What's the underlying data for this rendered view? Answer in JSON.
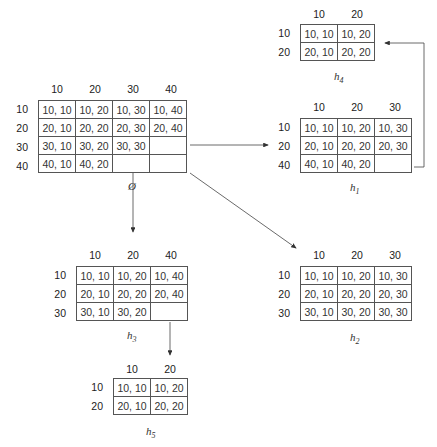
{
  "tables": {
    "empty": {
      "label": "Ø",
      "label_sub": "",
      "col_headers": [
        "10",
        "20",
        "30",
        "40"
      ],
      "row_headers": [
        "10",
        "20",
        "30",
        "40"
      ],
      "cells": [
        [
          "10, 10",
          "10, 20",
          "10, 30",
          "10, 40"
        ],
        [
          "20, 10",
          "20, 20",
          "20, 30",
          "20, 40"
        ],
        [
          "30, 10",
          "30, 20",
          "30, 30",
          ""
        ],
        [
          "40, 10",
          "40, 20",
          "",
          ""
        ]
      ]
    },
    "h1": {
      "label": "h",
      "label_sub": "1",
      "col_headers": [
        "10",
        "20",
        "30"
      ],
      "row_headers": [
        "10",
        "20",
        "40"
      ],
      "cells": [
        [
          "10, 10",
          "10, 20",
          "10, 30"
        ],
        [
          "20, 10",
          "20, 20",
          "20, 30"
        ],
        [
          "40, 10",
          "40, 20",
          ""
        ]
      ]
    },
    "h2": {
      "label": "h",
      "label_sub": "2",
      "col_headers": [
        "10",
        "20",
        "30"
      ],
      "row_headers": [
        "10",
        "20",
        "30"
      ],
      "cells": [
        [
          "10, 10",
          "10, 20",
          "10, 30"
        ],
        [
          "20, 10",
          "20, 20",
          "20, 30"
        ],
        [
          "30, 10",
          "30, 20",
          "30, 30"
        ]
      ]
    },
    "h3": {
      "label": "h",
      "label_sub": "3",
      "col_headers": [
        "10",
        "20",
        "40"
      ],
      "row_headers": [
        "10",
        "20",
        "30"
      ],
      "cells": [
        [
          "10, 10",
          "10, 20",
          "10, 40"
        ],
        [
          "20, 10",
          "20, 20",
          "20, 40"
        ],
        [
          "30, 10",
          "30, 20",
          ""
        ]
      ]
    },
    "h4": {
      "label": "h",
      "label_sub": "4",
      "col_headers": [
        "10",
        "20"
      ],
      "row_headers": [
        "10",
        "20"
      ],
      "cells": [
        [
          "10, 10",
          "10, 20"
        ],
        [
          "20, 10",
          "20, 20"
        ]
      ]
    },
    "h5": {
      "label": "h",
      "label_sub": "5",
      "col_headers": [
        "10",
        "20"
      ],
      "row_headers": [
        "10",
        "20"
      ],
      "cells": [
        [
          "10, 10",
          "10, 20"
        ],
        [
          "20, 10",
          "20, 20"
        ]
      ]
    }
  },
  "edges": [
    {
      "from": "empty",
      "to": "h1"
    },
    {
      "from": "empty",
      "to": "h2"
    },
    {
      "from": "empty",
      "to": "h3"
    },
    {
      "from": "h1",
      "to": "h4"
    },
    {
      "from": "h3",
      "to": "h5"
    }
  ]
}
